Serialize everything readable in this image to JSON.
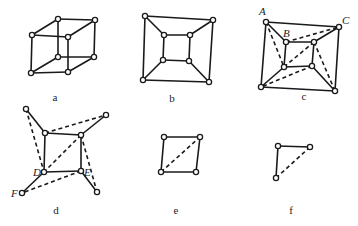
{
  "figure": {
    "panels": [
      {
        "id": "a",
        "caption": "a",
        "caption_pos": [
          55,
          101
        ],
        "nodes": [
          [
            32,
            35
          ],
          [
            68,
            37
          ],
          [
            31,
            73
          ],
          [
            68,
            72
          ],
          [
            58,
            19
          ],
          [
            95,
            20
          ],
          [
            58,
            57
          ],
          [
            94,
            57
          ]
        ],
        "edges": [
          [
            0,
            1
          ],
          [
            1,
            3
          ],
          [
            3,
            2
          ],
          [
            2,
            0
          ],
          [
            4,
            5
          ],
          [
            5,
            7
          ],
          [
            7,
            6
          ],
          [
            6,
            4
          ],
          [
            0,
            4
          ],
          [
            1,
            5
          ],
          [
            2,
            6
          ],
          [
            3,
            7
          ]
        ],
        "dashed": [],
        "labels": []
      },
      {
        "id": "b",
        "caption": "b",
        "caption_pos": [
          172,
          102
        ],
        "nodes": [
          [
            145,
            16
          ],
          [
            213,
            20
          ],
          [
            143,
            80
          ],
          [
            209,
            82
          ],
          [
            164,
            35
          ],
          [
            190,
            35
          ],
          [
            163,
            60
          ],
          [
            189,
            61
          ]
        ],
        "edges": [
          [
            0,
            1
          ],
          [
            1,
            3
          ],
          [
            3,
            2
          ],
          [
            2,
            0
          ],
          [
            4,
            5
          ],
          [
            5,
            7
          ],
          [
            7,
            6
          ],
          [
            6,
            4
          ],
          [
            0,
            4
          ],
          [
            1,
            5
          ],
          [
            2,
            6
          ],
          [
            3,
            7
          ]
        ],
        "dashed": [],
        "labels": []
      },
      {
        "id": "c",
        "caption": "c",
        "caption_pos": [
          304,
          100
        ],
        "nodes": [
          [
            266,
            22
          ],
          [
            339,
            27
          ],
          [
            261,
            87
          ],
          [
            335,
            91
          ],
          [
            286,
            42
          ],
          [
            314,
            42
          ],
          [
            284,
            67
          ],
          [
            312,
            66
          ]
        ],
        "edges": [
          [
            0,
            1
          ],
          [
            1,
            3
          ],
          [
            3,
            2
          ],
          [
            2,
            0
          ],
          [
            4,
            5
          ],
          [
            5,
            7
          ],
          [
            7,
            6
          ],
          [
            6,
            4
          ],
          [
            0,
            4
          ],
          [
            1,
            5
          ],
          [
            2,
            6
          ],
          [
            3,
            7
          ]
        ],
        "dashed": [
          [
            0,
            6
          ],
          [
            4,
            1
          ],
          [
            5,
            6
          ],
          [
            5,
            3
          ],
          [
            7,
            2
          ]
        ],
        "labels": [
          {
            "text": "A",
            "pos": [
              259,
              15
            ]
          },
          {
            "text": "C",
            "pos": [
              342,
              24
            ]
          },
          {
            "text": "B",
            "pos": [
              283,
              37
            ]
          }
        ]
      },
      {
        "id": "d",
        "caption": "d",
        "caption_pos": [
          56,
          214
        ],
        "nodes": [
          [
            26,
            109
          ],
          [
            106,
            115
          ],
          [
            45,
            133
          ],
          [
            81,
            135
          ],
          [
            44,
            172
          ],
          [
            81,
            171
          ],
          [
            22,
            193
          ],
          [
            97,
            192
          ]
        ],
        "edges": [
          [
            0,
            2
          ],
          [
            1,
            3
          ],
          [
            2,
            3
          ],
          [
            3,
            5
          ],
          [
            5,
            4
          ],
          [
            4,
            2
          ],
          [
            4,
            6
          ],
          [
            5,
            7
          ]
        ],
        "dashed": [
          [
            0,
            4
          ],
          [
            2,
            1
          ],
          [
            3,
            4
          ],
          [
            3,
            7
          ],
          [
            5,
            6
          ]
        ],
        "labels": [
          {
            "text": "D",
            "pos": [
              33,
              176
            ]
          },
          {
            "text": "E",
            "pos": [
              84,
              176
            ]
          },
          {
            "text": "F",
            "pos": [
              11,
              197
            ]
          }
        ]
      },
      {
        "id": "e",
        "caption": "e",
        "caption_pos": [
          176,
          214
        ],
        "nodes": [
          [
            164,
            137
          ],
          [
            200,
            137
          ],
          [
            161,
            172
          ],
          [
            196,
            172
          ]
        ],
        "edges": [
          [
            0,
            1
          ],
          [
            1,
            3
          ],
          [
            3,
            2
          ],
          [
            2,
            0
          ]
        ],
        "dashed": [
          [
            2,
            1
          ]
        ],
        "labels": []
      },
      {
        "id": "f",
        "caption": "f",
        "caption_pos": [
          291,
          214
        ],
        "nodes": [
          [
            278,
            146
          ],
          [
            310,
            147
          ],
          [
            276,
            178
          ]
        ],
        "edges": [
          [
            0,
            1
          ],
          [
            0,
            2
          ]
        ],
        "dashed": [
          [
            2,
            1
          ]
        ],
        "labels": []
      }
    ]
  },
  "colors": {
    "stroke": "#1a1a1a",
    "background": "#ffffff"
  }
}
